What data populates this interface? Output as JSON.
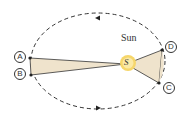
{
  "sun_label": "Sun",
  "sun_symbol": "S",
  "points": {
    "a": "A",
    "b": "B",
    "c": "C",
    "d": "D"
  },
  "colors": {
    "sector": "#efe3cc",
    "sun": "#f6d66a",
    "orbit": "#333333"
  }
}
